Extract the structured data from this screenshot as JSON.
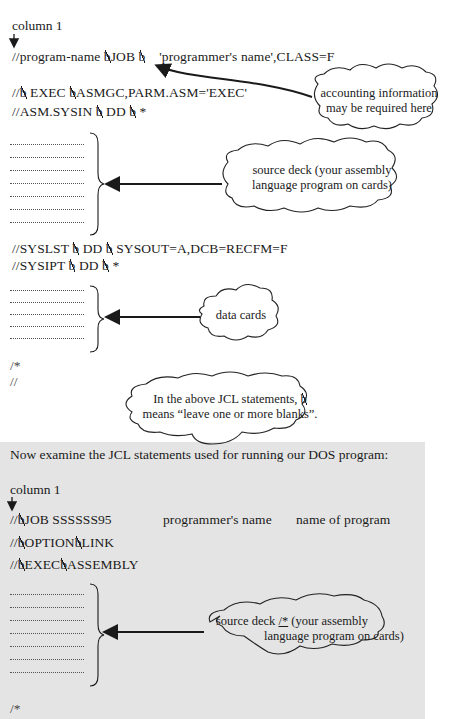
{
  "os_section": {
    "column_label": "column 1",
    "jcl_lines": {
      "job_line_prefix": "//program-name ",
      "job_line_job": "JOB",
      "job_line_suffix": "'programmer's name',CLASS=F",
      "exec_prefix": "//",
      "exec_mid": " EXEC ",
      "exec_suffix": "ASMGC,PARM.ASM='EXEC'",
      "sysin_prefix": "//ASM.SYSIN ",
      "sysin_mid": " DD ",
      "sysin_suffix": "*",
      "syslst_prefix": "//SYSLST ",
      "syslst_mid": " DD ",
      "syslst_suffix": "SYSOUT=A,DCB=RECFM=F",
      "sysipt_prefix": "//SYSIPT ",
      "sysipt_mid": " DD ",
      "sysipt_suffix": "*",
      "end_data": "/*",
      "end_job": "//"
    },
    "blank_symbol": "b",
    "callouts": {
      "accounting_line1": "accounting information",
      "accounting_line2": "may be required here",
      "source_deck_line1": "source deck (your assembly",
      "source_deck_line2": "language program on cards)",
      "data_cards": "data cards",
      "note_line1_prefix": "In the above JCL statements,",
      "note_line2": "means “leave one or more blanks”."
    },
    "source_deck_card_rows": 7,
    "data_card_rows": 5
  },
  "dos_section": {
    "intro": "Now examine the JCL statements used for running our DOS program:",
    "column_label": "column 1",
    "jcl_lines": {
      "job_prefix": "//",
      "job_text": "JOB  SSSSSS95",
      "job_programmer": "programmer's name",
      "job_program": "name of program",
      "option_prefix": "//",
      "option_mid": "OPTION",
      "option_suffix": "LINK",
      "exec_prefix": "//",
      "exec_mid": "EXEC",
      "exec_suffix": "ASSEMBLY",
      "end_data": "/*"
    },
    "callouts": {
      "source_deck_line1_a": "source deck ",
      "source_deck_marker": "/*",
      "source_deck_line1_b": " (your assembly",
      "source_deck_line2": "language program on cards)"
    },
    "source_deck_card_rows": 7
  },
  "colors": {
    "panel_background": "#e4e4e4",
    "ink": "#1a1a1a"
  }
}
